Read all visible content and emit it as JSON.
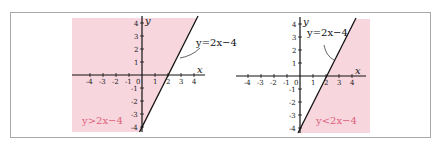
{
  "figure": {
    "left_panel": {
      "line_label": "y=2x−4",
      "region_label": "y>2x−4",
      "x_axis_label": "x",
      "y_axis_label": "y",
      "origin_label": "0",
      "x_ticks": [
        "-4",
        "-3",
        "-2",
        "-1",
        "1",
        "2",
        "3",
        "4"
      ],
      "y_ticks": [
        "4",
        "3",
        "2",
        "1",
        "-1",
        "-2",
        "-3",
        "-4"
      ],
      "shaded": "above line"
    },
    "right_panel": {
      "line_label": "y=2x−4",
      "region_label": "y<2x−4",
      "x_axis_label": "x",
      "y_axis_label": "y",
      "origin_label": "0",
      "x_ticks": [
        "-4",
        "-3",
        "-2",
        "-1",
        "1",
        "2",
        "3",
        "4"
      ],
      "y_ticks": [
        "4",
        "3",
        "2",
        "1",
        "-1",
        "-2",
        "-3",
        "-4"
      ],
      "shaded": "below line"
    },
    "colors": {
      "shade": "#f7d6de",
      "region_text": "#e0607a",
      "line": "#111111",
      "frame": "#a8a8a8"
    }
  }
}
